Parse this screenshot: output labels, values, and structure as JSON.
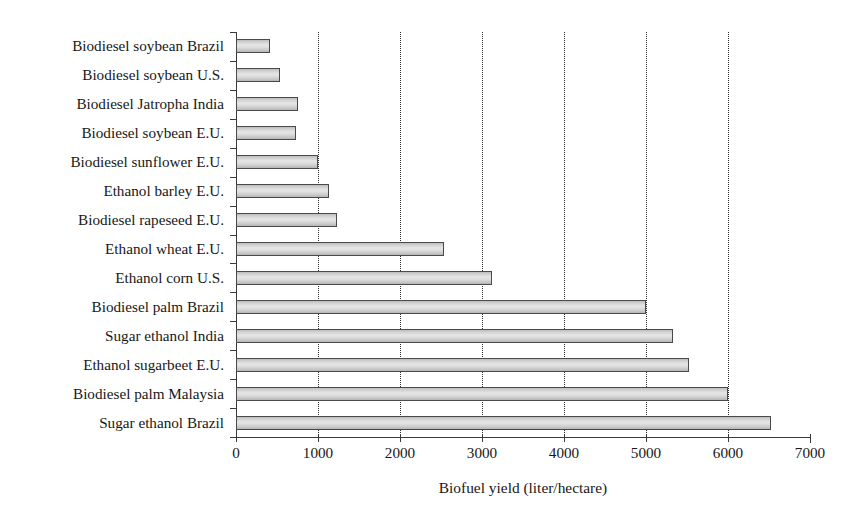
{
  "chart_data": {
    "type": "bar",
    "orientation": "horizontal",
    "title": "",
    "subtitle": "",
    "xlabel": "Biofuel yield (liter/hectare)",
    "ylabel": "",
    "xlim": [
      0,
      7000
    ],
    "xticks": [
      0,
      1000,
      2000,
      3000,
      4000,
      5000,
      6000,
      7000
    ],
    "xticklabels": [
      "0",
      "1000",
      "2000",
      "3000",
      "4000",
      "5000",
      "6000",
      "7000"
    ],
    "grid": "vertical-dotted",
    "legend": "none",
    "categories": [
      "Biodiesel soybean Brazil",
      "Biodiesel soybean U.S.",
      "Biodiesel Jatropha India",
      "Biodiesel soybean E.U.",
      "Biodiesel sunflower E.U.",
      "Ethanol barley E.U.",
      "Biodiesel rapeseed E.U.",
      "Ethanol wheat E.U.",
      "Ethanol corn U.S.",
      "Biodiesel palm Brazil",
      "Sugar ethanol India",
      "Ethanol sugarbeet E.U.",
      "Biodiesel palm Malaysia",
      "Sugar ethanol Brazil"
    ],
    "values": [
      420,
      540,
      750,
      730,
      1000,
      1130,
      1230,
      2540,
      3120,
      5000,
      5330,
      5530,
      6000,
      6530
    ],
    "bar_fill": "#d8d8d8",
    "bar_edge": "#4a4a4a",
    "gridline_color": "#2b2b2b",
    "axis_color": "#3a3a3a",
    "text_color": "#171717",
    "background": "#ffffff"
  }
}
